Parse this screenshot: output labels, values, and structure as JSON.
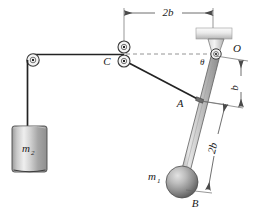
{
  "figure": {
    "background_color": "#ffffff",
    "line_color": "#2b2b2b",
    "dim_color": "#555555"
  },
  "labels": {
    "point_O": "O",
    "point_A": "A",
    "point_B": "B",
    "point_C": "C",
    "angle_theta": "θ",
    "mass_pendulum": "m",
    "mass_pendulum_sub": "1",
    "mass_block": "m",
    "mass_block_sub": "2",
    "dim_top": "2b",
    "dim_right_upper": "b",
    "dim_right_lower": "2b"
  },
  "geometry": {
    "pivot_O": [
      216,
      54
    ],
    "point_A": [
      199,
      100
    ],
    "point_B": [
      182,
      182
    ],
    "pulley_C_upper": [
      124,
      47
    ],
    "pulley_C_lower": [
      124,
      61
    ],
    "pulley_left": [
      33,
      60
    ],
    "block_m2": {
      "x": 12,
      "y": 126,
      "w": 35,
      "h": 46
    },
    "ball_m1": {
      "cx": 182,
      "cy": 182,
      "r": 16
    },
    "ceiling_block": {
      "x": 196,
      "y": 28,
      "w": 36,
      "h": 11
    },
    "dim_top_line_y": 13,
    "dim_top_x_start": 124,
    "dim_top_x_end": 213
  },
  "colors": {
    "metal_light": "#f2f2f2",
    "metal_mid": "#b8b8b8",
    "metal_dark": "#7d7d7d",
    "sphere_light": "#d6d6d6",
    "sphere_dark": "#6e6e6e",
    "rod_light": "#e8e8e8",
    "rod_dark": "#8c8c8c"
  }
}
